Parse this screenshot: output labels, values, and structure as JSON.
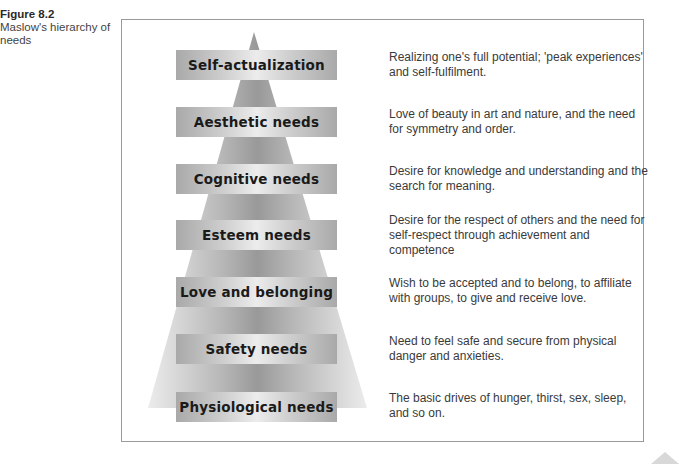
{
  "caption": {
    "figure_label": "Figure 8.2",
    "title": "Maslow's hierarchy of needs"
  },
  "pyramid": {
    "levels": [
      {
        "name": "Self-actualization",
        "description": "Realizing one's full potential; 'peak experiences' and self-fulfilment."
      },
      {
        "name": "Aesthetic needs",
        "description": "Love of beauty in art and nature, and the need for symmetry and order."
      },
      {
        "name": "Cognitive needs",
        "description": "Desire for knowledge and understanding and the search for meaning."
      },
      {
        "name": "Esteem needs",
        "description": "Desire for the respect of others and the need for self-respect through achievement and competence"
      },
      {
        "name": "Love and belonging",
        "description": "Wish to be accepted and to belong, to affiliate with groups, to give and receive love."
      },
      {
        "name": "Safety needs",
        "description": "Need to feel safe and secure from physical danger and anxieties."
      },
      {
        "name": "Physiological needs",
        "description": "The basic drives of hunger, thirst, sex, sleep, and so on."
      }
    ]
  },
  "colors": {
    "pyramid_center": "#9a9a9a",
    "pyramid_edge": "#e6e6e6",
    "frame_border": "#9a9a9a",
    "label_text": "#1a1a1a",
    "description_text": "#3a3a3a"
  }
}
